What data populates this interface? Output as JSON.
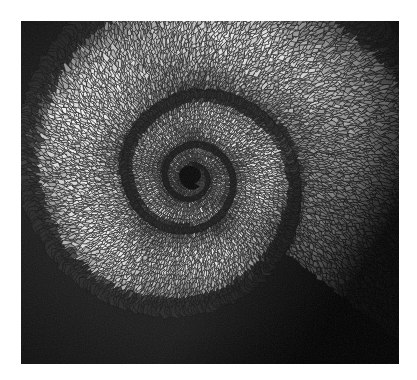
{
  "page": {
    "background_color": "#ffffff",
    "width": 417,
    "height": 380,
    "caption": ""
  },
  "photo": {
    "title": "Coiled chameleon tail",
    "subject": "reptile tail spiral of polygonal scales",
    "color_mode": "black-and-white",
    "frame": {
      "x": 21,
      "y": 21,
      "width": 378,
      "height": 343
    },
    "background_color": "#050505",
    "palette": {
      "darkest": "#070707",
      "dark": "#2a2a2a",
      "mid_dark": "#4e4e4e",
      "mid": "#7d7d7d",
      "mid_light": "#a8a8a8",
      "light": "#cfcfcf",
      "lightest": "#f2f2f2"
    },
    "spiral": {
      "center_x": 170,
      "center_y": 157,
      "turns": 3.1,
      "core_void_color": "#0a0a0a",
      "core_radius": 11,
      "growth_factor": 2.55,
      "groove_color": "#101010",
      "description": "logarithmic spiral coil of a lizard tail seen end-on, scales arranged in concentric rows"
    },
    "corners": {
      "top_right_dark": true,
      "bottom_right_dark": false
    }
  }
}
